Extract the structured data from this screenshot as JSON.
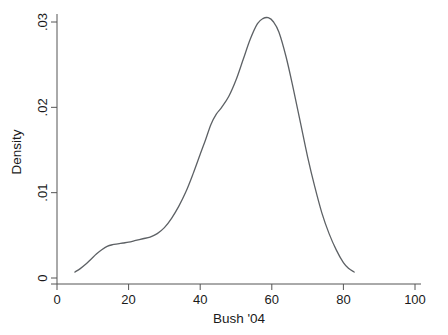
{
  "chart_data": {
    "type": "line",
    "title": "",
    "subtitle": "",
    "xlabel": "Bush '04",
    "ylabel": "Density",
    "xlim": [
      0,
      100
    ],
    "ylim": [
      0,
      0.0325
    ],
    "grid": false,
    "legend": null,
    "legend_position": "none",
    "xticks": [
      0,
      20,
      40,
      60,
      80,
      100
    ],
    "xticklabels": [
      "0",
      "20",
      "40",
      "60",
      "80",
      "100"
    ],
    "yticks": [
      0,
      0.01,
      0.02,
      0.03
    ],
    "yticklabels": [
      "0",
      ".01",
      ".02",
      ".03"
    ],
    "series": [
      {
        "name": "Kernel density of Bush '04 vote share",
        "color": "#5d6165",
        "x": [
          5.0,
          6.5,
          8.0,
          9.5,
          11.0,
          12.5,
          14.0,
          15.5,
          17.0,
          18.5,
          20.0,
          22.0,
          24.0,
          26.0,
          28.0,
          30.0,
          32.0,
          34.0,
          36.0,
          38.0,
          40.0,
          41.5,
          43.0,
          44.5,
          46.0,
          48.0,
          50.0,
          52.0,
          54.0,
          56.0,
          57.5,
          59.0,
          60.5,
          62.0,
          64.0,
          66.0,
          68.0,
          70.0,
          72.0,
          74.0,
          76.0,
          78.0,
          80.0,
          81.5,
          83.0
        ],
        "y": [
          0.0007,
          0.0011,
          0.0016,
          0.0022,
          0.0028,
          0.0033,
          0.0037,
          0.0039,
          0.004,
          0.0041,
          0.0042,
          0.0044,
          0.0046,
          0.0048,
          0.0052,
          0.0059,
          0.007,
          0.0084,
          0.0101,
          0.0122,
          0.0145,
          0.0162,
          0.018,
          0.0192,
          0.02,
          0.0213,
          0.0232,
          0.0256,
          0.028,
          0.0298,
          0.0304,
          0.0305,
          0.03,
          0.0288,
          0.0259,
          0.0222,
          0.0182,
          0.0142,
          0.0107,
          0.0076,
          0.0052,
          0.0033,
          0.0018,
          0.0011,
          0.0007
        ]
      }
    ]
  },
  "axes": {
    "y_axis_title": "Density",
    "x_axis_title": "Bush '04"
  }
}
